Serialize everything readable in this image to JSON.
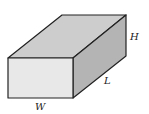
{
  "diagram": {
    "type": "rectangular-prism",
    "labels": {
      "height": "H",
      "length": "L",
      "width": "W"
    },
    "colors": {
      "top_face": "#cdcdcd",
      "front_face": "#e8e8e8",
      "side_face": "#b4b4b4",
      "edge": "#222222",
      "background": "#ffffff"
    }
  }
}
